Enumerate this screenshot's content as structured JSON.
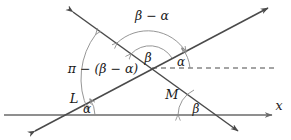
{
  "figure": {
    "background": "#ffffff",
    "line_color": "#4a4a4a",
    "arc_color": "#8a8a8a",
    "axis_color": "#6a6a6a",
    "text_color": "#1a1a1a",
    "width": 291,
    "height": 140
  },
  "labels": {
    "beta_minus_alpha": "β − α",
    "pi_minus_beta_minus_alpha": "π − (β − α)",
    "beta_center": "β",
    "alpha_center": "α",
    "alpha_axis": "α",
    "beta_axis": "β",
    "line_L": "L",
    "line_M": "M",
    "axis_x": "x"
  },
  "geometry": {
    "x_axis": {
      "y": 115,
      "x_start": 4,
      "x_end": 272
    },
    "intersection": {
      "x": 152,
      "y": 68
    },
    "line_L": {
      "name": "L",
      "from": {
        "x": 35,
        "y": 131
      },
      "to": {
        "x": 268,
        "y": 8
      },
      "axis_crossing": {
        "x": 65,
        "y": 115
      },
      "angle_at_axis": "α"
    },
    "line_M": {
      "name": "M",
      "from": {
        "x": 73,
        "y": 12
      },
      "to": {
        "x": 238,
        "y": 131
      },
      "axis_crossing": {
        "x": 206,
        "y": 115
      },
      "angle_at_axis": "β"
    },
    "dashed_ray": {
      "from": {
        "x": 152,
        "y": 68
      },
      "to": {
        "x": 276,
        "y": 68
      }
    }
  }
}
